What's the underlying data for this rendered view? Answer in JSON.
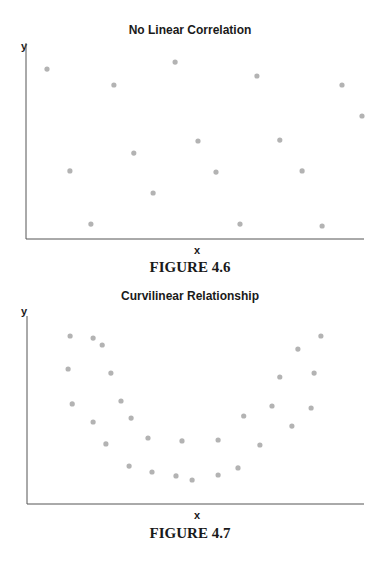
{
  "chart_data": [
    {
      "type": "scatter",
      "title": "No Linear Correlation",
      "caption": "FIGURE 4.6",
      "xlabel": "x",
      "ylabel": "y",
      "xlim": [
        0,
        10
      ],
      "ylim": [
        0,
        10
      ],
      "grid": false,
      "legend": null,
      "axis_ticks": false,
      "point_color": "#b3b3b3",
      "points": [
        {
          "x": 0.62,
          "y": 8.76
        },
        {
          "x": 1.3,
          "y": 3.51
        },
        {
          "x": 1.92,
          "y": 0.77
        },
        {
          "x": 2.6,
          "y": 7.94
        },
        {
          "x": 3.19,
          "y": 4.43
        },
        {
          "x": 3.76,
          "y": 2.37
        },
        {
          "x": 4.41,
          "y": 9.12
        },
        {
          "x": 5.09,
          "y": 5.05
        },
        {
          "x": 5.62,
          "y": 3.45
        },
        {
          "x": 6.33,
          "y": 0.77
        },
        {
          "x": 6.83,
          "y": 8.4
        },
        {
          "x": 7.51,
          "y": 5.1
        },
        {
          "x": 8.17,
          "y": 3.51
        },
        {
          "x": 8.76,
          "y": 0.67
        },
        {
          "x": 9.35,
          "y": 7.94
        },
        {
          "x": 9.94,
          "y": 6.34
        }
      ]
    },
    {
      "type": "scatter",
      "title": "Curvilinear Relationship",
      "caption": "FIGURE 4.7",
      "xlabel": "x",
      "ylabel": "y",
      "xlim": [
        0,
        10
      ],
      "ylim": [
        0,
        10
      ],
      "grid": false,
      "legend": null,
      "axis_ticks": false,
      "point_color": "#b3b3b3",
      "points": [
        {
          "x": 1.28,
          "y": 9.03
        },
        {
          "x": 1.96,
          "y": 8.92
        },
        {
          "x": 2.23,
          "y": 8.55
        },
        {
          "x": 1.22,
          "y": 7.26
        },
        {
          "x": 2.49,
          "y": 7.04
        },
        {
          "x": 1.34,
          "y": 5.38
        },
        {
          "x": 2.79,
          "y": 5.54
        },
        {
          "x": 1.96,
          "y": 4.41
        },
        {
          "x": 3.09,
          "y": 4.62
        },
        {
          "x": 2.34,
          "y": 3.23
        },
        {
          "x": 3.59,
          "y": 3.55
        },
        {
          "x": 3.03,
          "y": 2.04
        },
        {
          "x": 3.71,
          "y": 1.72
        },
        {
          "x": 4.42,
          "y": 1.51
        },
        {
          "x": 4.9,
          "y": 1.29
        },
        {
          "x": 4.6,
          "y": 3.39
        },
        {
          "x": 5.67,
          "y": 1.56
        },
        {
          "x": 5.67,
          "y": 3.44
        },
        {
          "x": 6.26,
          "y": 1.94
        },
        {
          "x": 6.91,
          "y": 3.17
        },
        {
          "x": 6.43,
          "y": 4.73
        },
        {
          "x": 7.27,
          "y": 5.27
        },
        {
          "x": 7.5,
          "y": 6.83
        },
        {
          "x": 8.04,
          "y": 8.33
        },
        {
          "x": 7.86,
          "y": 4.19
        },
        {
          "x": 8.43,
          "y": 5.16
        },
        {
          "x": 8.52,
          "y": 7.04
        },
        {
          "x": 8.72,
          "y": 9.03
        }
      ]
    }
  ]
}
